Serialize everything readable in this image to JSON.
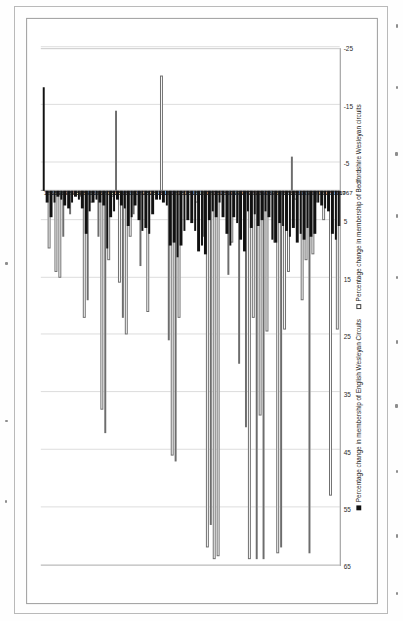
{
  "figure": {
    "orientation": "printed-sideways",
    "legend_position": "bottom",
    "series_colors": {
      "english": "#111111",
      "bedfordshire": "#ffffff",
      "bedfordshire_outline": "#6d6d6d"
    }
  },
  "legend": {
    "english_label": "Percentage change in membership of English Wesleyan Circuits",
    "bedfordshire_label": "Percentage change in membership of Bedfordshire Wesleyan circuits"
  },
  "axis": {
    "ticks": [
      "65",
      "55",
      "45",
      "35",
      "25",
      "15",
      "5",
      "-5",
      "-15",
      "-25"
    ],
    "min": -25,
    "max": 65,
    "zero": 0
  },
  "chart_data": {
    "type": "bar",
    "title": "",
    "subtitle": "",
    "xlabel": "",
    "ylabel": "",
    "orientation": "horizontal",
    "xlim": [
      -25,
      65
    ],
    "grid": true,
    "legend_position": "bottom",
    "tick_labels": [
      "65",
      "55",
      "45",
      "35",
      "25",
      "15",
      "5",
      "-5",
      "-15",
      "-25"
    ],
    "categories": [
      "1767",
      "1768",
      "1769",
      "1770",
      "1771",
      "1772",
      "1773",
      "1774",
      "1775",
      "1776",
      "1777",
      "1778",
      "1779",
      "1780",
      "1781",
      "1782",
      "1783",
      "1784",
      "1785",
      "1786",
      "1787",
      "1788",
      "1789",
      "1790",
      "1791",
      "1792",
      "1793",
      "1794",
      "1795",
      "1796",
      "1797",
      "1798",
      "1799",
      "1800",
      "1801",
      "1802",
      "1803",
      "1804",
      "1805",
      "1806",
      "1807",
      "1808",
      "1809",
      "1810",
      "1811",
      "1812",
      "1813",
      "1814",
      "1815",
      "1816",
      "1817",
      "1818",
      "1819",
      "1820",
      "1821",
      "1822",
      "1823",
      "1824",
      "1825",
      "1826",
      "1827",
      "1828",
      "1829",
      "1830",
      "1831",
      "1832",
      "1833",
      "1834",
      "1835",
      "1836",
      "1837",
      "1838",
      "1839",
      "1840",
      "1841",
      "1842",
      "1843",
      "1844",
      "1845",
      "1846",
      "1847",
      "1848",
      "1849",
      "1850",
      "1851"
    ],
    "series": [
      {
        "name": "Percentage change in membership of English Wesleyan Circuits",
        "key": "english",
        "color": "#111111",
        "values": [
          6.0,
          8.5,
          7.5,
          3.5,
          3.0,
          2.5,
          2.0,
          7.5,
          8.0,
          6.5,
          8.5,
          7.5,
          9.0,
          6.5,
          8.0,
          7.0,
          6.0,
          5.5,
          9.0,
          8.5,
          4.5,
          3.5,
          5.0,
          6.0,
          4.0,
          6.5,
          3.5,
          10.5,
          8.5,
          5.5,
          4.5,
          9.5,
          7.5,
          4.5,
          2.0,
          4.5,
          3.5,
          5.0,
          11.0,
          9.5,
          10.5,
          7.0,
          5.5,
          5.0,
          7.0,
          9.5,
          11.5,
          9.0,
          9.5,
          2.5,
          2.0,
          1.5,
          1.5,
          4.0,
          7.5,
          6.5,
          7.0,
          5.0,
          2.5,
          4.5,
          6.0,
          3.0,
          2.5,
          1.5,
          3.5,
          4.5,
          10.0,
          2.5,
          2.0,
          1.5,
          2.0,
          3.5,
          7.5,
          3.0,
          1.5,
          1.0,
          2.0,
          3.0,
          2.5,
          1.5,
          1.0,
          2.0,
          4.5,
          2.0,
          -18.0
        ]
      },
      {
        "name": "Percentage change in membership of Bedfordshire Wesleyan circuits",
        "key": "bedfordshire",
        "color": "#ffffff",
        "values": [
          24.0,
          0.0,
          53.0,
          0.0,
          5.0,
          0.0,
          2.0,
          11.0,
          63.0,
          12.0,
          19.0,
          0.0,
          1.5,
          -6.0,
          14.0,
          24.0,
          62.0,
          63.0,
          9.0,
          0.0,
          24.5,
          64.0,
          39.0,
          64.0,
          22.0,
          64.0,
          41.0,
          0.0,
          30.0,
          0.0,
          9.0,
          14.5,
          0.0,
          0.0,
          63.5,
          64.0,
          58.0,
          62.0,
          8.0,
          0.0,
          2.0,
          0.0,
          0.0,
          0.0,
          0.0,
          22.0,
          47.0,
          46.0,
          26.0,
          0.0,
          -20.0,
          0.0,
          0.0,
          0.0,
          21.0,
          0.0,
          13.0,
          0.0,
          4.0,
          8.0,
          25.0,
          22.0,
          16.0,
          -14.0,
          1.0,
          12.0,
          42.0,
          38.0,
          8.0,
          0.0,
          2.0,
          19.0,
          22.0,
          1.0,
          0.0,
          0.0,
          4.0,
          0.0,
          8.0,
          15.0,
          14.0,
          0.0,
          10.0,
          0.0,
          0.0
        ]
      }
    ]
  }
}
